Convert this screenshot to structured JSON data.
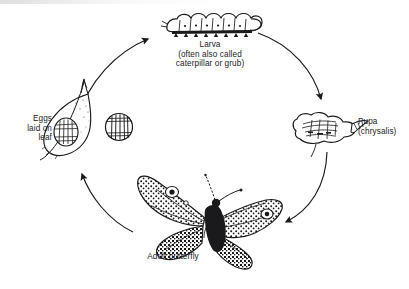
{
  "diagram": {
    "type": "cycle-diagram",
    "background_color": "#ffffff",
    "ink_color": "#1a1a1d",
    "text_color": "#222225",
    "stages": [
      {
        "id": "eggs",
        "label_lines": "Eggs\nlaid on\nleaf",
        "illustration": "leaf-with-egg-drawing",
        "position": "left"
      },
      {
        "id": "larva",
        "label_lines": "Larva\n(often also called\ncaterpillar or grub)",
        "illustration": "caterpillar-drawing",
        "position": "top"
      },
      {
        "id": "pupa",
        "label_lines": "Pupa\n(chrysalis)",
        "illustration": "chrysalis-drawing",
        "position": "right"
      },
      {
        "id": "adult",
        "label_lines": "Adult butterfly",
        "illustration": "butterfly-drawing",
        "position": "bottom"
      }
    ],
    "detail_inset": {
      "id": "egg-enlarged",
      "illustration": "ribbed-egg-drawing",
      "label": ""
    },
    "arrows": [
      {
        "id": "eggs-to-larva",
        "from": "eggs",
        "to": "larva"
      },
      {
        "id": "larva-to-pupa",
        "from": "larva",
        "to": "pupa"
      },
      {
        "id": "pupa-to-adult",
        "from": "pupa",
        "to": "adult"
      },
      {
        "id": "adult-to-eggs",
        "from": "adult",
        "to": "eggs"
      }
    ]
  }
}
